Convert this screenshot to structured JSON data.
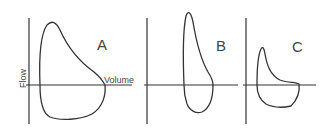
{
  "diagram": {
    "type": "flow-volume loops",
    "axis_labels": {
      "y": "Flow",
      "x": "Volume"
    },
    "panels": [
      {
        "label": "A",
        "description": "normal flow-volume loop"
      },
      {
        "label": "B",
        "description": "narrow tall loop"
      },
      {
        "label": "C",
        "description": "scooped expiratory loop"
      }
    ]
  }
}
